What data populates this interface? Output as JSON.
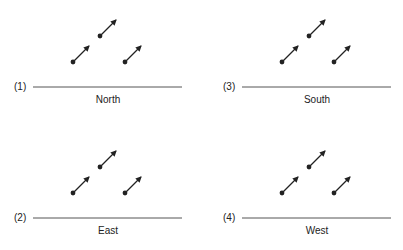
{
  "panels": [
    {
      "number": "(1)",
      "label": "North",
      "ox": 0,
      "oy": 0
    },
    {
      "number": "(2)",
      "label": "East",
      "ox": 0,
      "oy": 131
    },
    {
      "number": "(3)",
      "label": "South",
      "ox": 209,
      "oy": 0
    },
    {
      "number": "(4)",
      "label": "West",
      "ox": 209,
      "oy": 131
    }
  ],
  "colors": {
    "ink": "#222222",
    "line": "#555555"
  }
}
